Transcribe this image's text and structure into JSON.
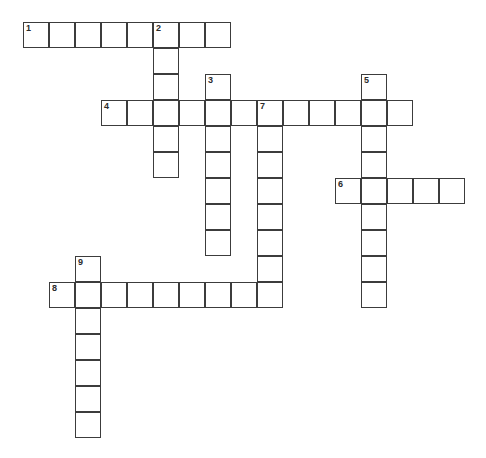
{
  "puzzle": {
    "type": "crossword-grid",
    "title": "",
    "cell_size": 26,
    "origin_x": 23,
    "origin_y": 22,
    "grid_cols": 17,
    "grid_rows": 16,
    "colors": {
      "background": "#ffffff",
      "cell_fill": "#ffffff",
      "cell_border": "#3c3c3c",
      "clue_number_text": "#2b2b2b"
    },
    "entries": [
      {
        "number": "1",
        "direction": "across",
        "start_col": 0,
        "start_row": 0,
        "length": 8
      },
      {
        "number": "2",
        "direction": "down",
        "start_col": 5,
        "start_row": 0,
        "length": 6
      },
      {
        "number": "3",
        "direction": "down",
        "start_col": 7,
        "start_row": 2,
        "length": 7
      },
      {
        "number": "4",
        "direction": "across",
        "start_col": 3,
        "start_row": 3,
        "length": 12
      },
      {
        "number": "5",
        "direction": "down",
        "start_col": 13,
        "start_row": 2,
        "length": 9
      },
      {
        "number": "6",
        "direction": "across",
        "start_col": 12,
        "start_row": 6,
        "length": 5
      },
      {
        "number": "7",
        "direction": "down",
        "start_col": 9,
        "start_row": 3,
        "length": 8
      },
      {
        "number": "8",
        "direction": "across",
        "start_col": 1,
        "start_row": 10,
        "length": 9
      },
      {
        "number": "9",
        "direction": "down",
        "start_col": 2,
        "start_row": 9,
        "length": 7
      }
    ],
    "cells": [
      {
        "col": 0,
        "row": 0,
        "number": "1",
        "letter": ""
      },
      {
        "col": 1,
        "row": 0,
        "number": "",
        "letter": ""
      },
      {
        "col": 2,
        "row": 0,
        "number": "",
        "letter": ""
      },
      {
        "col": 3,
        "row": 0,
        "number": "",
        "letter": ""
      },
      {
        "col": 4,
        "row": 0,
        "number": "",
        "letter": ""
      },
      {
        "col": 5,
        "row": 0,
        "number": "2",
        "letter": ""
      },
      {
        "col": 6,
        "row": 0,
        "number": "",
        "letter": ""
      },
      {
        "col": 7,
        "row": 0,
        "number": "",
        "letter": ""
      },
      {
        "col": 5,
        "row": 1,
        "number": "",
        "letter": ""
      },
      {
        "col": 5,
        "row": 2,
        "number": "",
        "letter": ""
      },
      {
        "col": 7,
        "row": 2,
        "number": "3",
        "letter": ""
      },
      {
        "col": 13,
        "row": 2,
        "number": "5",
        "letter": ""
      },
      {
        "col": 3,
        "row": 3,
        "number": "4",
        "letter": ""
      },
      {
        "col": 4,
        "row": 3,
        "number": "",
        "letter": ""
      },
      {
        "col": 5,
        "row": 3,
        "number": "",
        "letter": ""
      },
      {
        "col": 6,
        "row": 3,
        "number": "",
        "letter": ""
      },
      {
        "col": 7,
        "row": 3,
        "number": "",
        "letter": ""
      },
      {
        "col": 8,
        "row": 3,
        "number": "",
        "letter": ""
      },
      {
        "col": 9,
        "row": 3,
        "number": "7",
        "letter": ""
      },
      {
        "col": 10,
        "row": 3,
        "number": "",
        "letter": ""
      },
      {
        "col": 11,
        "row": 3,
        "number": "",
        "letter": ""
      },
      {
        "col": 12,
        "row": 3,
        "number": "",
        "letter": ""
      },
      {
        "col": 13,
        "row": 3,
        "number": "",
        "letter": ""
      },
      {
        "col": 14,
        "row": 3,
        "number": "",
        "letter": ""
      },
      {
        "col": 5,
        "row": 4,
        "number": "",
        "letter": ""
      },
      {
        "col": 7,
        "row": 4,
        "number": "",
        "letter": ""
      },
      {
        "col": 9,
        "row": 4,
        "number": "",
        "letter": ""
      },
      {
        "col": 13,
        "row": 4,
        "number": "",
        "letter": ""
      },
      {
        "col": 5,
        "row": 5,
        "number": "",
        "letter": ""
      },
      {
        "col": 7,
        "row": 5,
        "number": "",
        "letter": ""
      },
      {
        "col": 9,
        "row": 5,
        "number": "",
        "letter": ""
      },
      {
        "col": 13,
        "row": 5,
        "number": "",
        "letter": ""
      },
      {
        "col": 7,
        "row": 6,
        "number": "",
        "letter": ""
      },
      {
        "col": 9,
        "row": 6,
        "number": "",
        "letter": ""
      },
      {
        "col": 12,
        "row": 6,
        "number": "6",
        "letter": ""
      },
      {
        "col": 13,
        "row": 6,
        "number": "",
        "letter": ""
      },
      {
        "col": 14,
        "row": 6,
        "number": "",
        "letter": ""
      },
      {
        "col": 15,
        "row": 6,
        "number": "",
        "letter": ""
      },
      {
        "col": 16,
        "row": 6,
        "number": "",
        "letter": ""
      },
      {
        "col": 7,
        "row": 7,
        "number": "",
        "letter": ""
      },
      {
        "col": 9,
        "row": 7,
        "number": "",
        "letter": ""
      },
      {
        "col": 13,
        "row": 7,
        "number": "",
        "letter": ""
      },
      {
        "col": 7,
        "row": 8,
        "number": "",
        "letter": ""
      },
      {
        "col": 9,
        "row": 8,
        "number": "",
        "letter": ""
      },
      {
        "col": 13,
        "row": 8,
        "number": "",
        "letter": ""
      },
      {
        "col": 2,
        "row": 9,
        "number": "9",
        "letter": ""
      },
      {
        "col": 9,
        "row": 9,
        "number": "",
        "letter": ""
      },
      {
        "col": 13,
        "row": 9,
        "number": "",
        "letter": ""
      },
      {
        "col": 1,
        "row": 10,
        "number": "8",
        "letter": ""
      },
      {
        "col": 2,
        "row": 10,
        "number": "",
        "letter": ""
      },
      {
        "col": 3,
        "row": 10,
        "number": "",
        "letter": ""
      },
      {
        "col": 4,
        "row": 10,
        "number": "",
        "letter": ""
      },
      {
        "col": 5,
        "row": 10,
        "number": "",
        "letter": ""
      },
      {
        "col": 6,
        "row": 10,
        "number": "",
        "letter": ""
      },
      {
        "col": 7,
        "row": 10,
        "number": "",
        "letter": ""
      },
      {
        "col": 8,
        "row": 10,
        "number": "",
        "letter": ""
      },
      {
        "col": 9,
        "row": 10,
        "number": "",
        "letter": ""
      },
      {
        "col": 13,
        "row": 10,
        "number": "",
        "letter": ""
      },
      {
        "col": 2,
        "row": 11,
        "number": "",
        "letter": ""
      },
      {
        "col": 2,
        "row": 12,
        "number": "",
        "letter": ""
      },
      {
        "col": 2,
        "row": 13,
        "number": "",
        "letter": ""
      },
      {
        "col": 2,
        "row": 14,
        "number": "",
        "letter": ""
      },
      {
        "col": 2,
        "row": 15,
        "number": "",
        "letter": ""
      }
    ]
  }
}
